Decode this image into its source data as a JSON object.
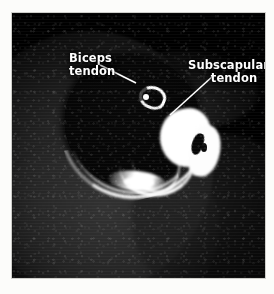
{
  "figure": {
    "kind": "medical-imaging-figure",
    "modality_appearance": "axial cross-sectional shoulder scan, greyscale",
    "background_color": "#fcfcfa",
    "scan_background_color": "#000000",
    "label_color": "#ffffff"
  },
  "annotations": [
    {
      "id": "biceps",
      "name": "biceps-tendon-label",
      "line1": "Biceps",
      "line2": "tendon",
      "align": "left",
      "leader": {
        "from_x": 100,
        "from_y": 65,
        "to_x": 136,
        "to_y": 83,
        "color": "#ffffff"
      }
    },
    {
      "id": "subscapularis",
      "name": "subscapularis-tendon-label",
      "line1": "Subscapularis",
      "line2": "tendon",
      "align": "center",
      "leader": {
        "from_x": 213,
        "from_y": 76,
        "to_x": 170,
        "to_y": 115,
        "color": "#ffffff"
      }
    }
  ],
  "structures": [
    {
      "name": "humeral-head",
      "appearance": "large dark round region, left of center"
    },
    {
      "name": "biceps-tendon",
      "appearance": "small bright hooked signal in bicipital groove"
    },
    {
      "name": "subscapularis-tendon",
      "appearance": "bright irregular mass, right of center"
    },
    {
      "name": "joint-capsule-band",
      "appearance": "thin bright band sweeping infero-medially"
    },
    {
      "name": "cortical-rim",
      "appearance": "bright curved cortex along infero-lateral humeral head"
    },
    {
      "name": "soft-tissue",
      "appearance": "mottled dark grey muscle surrounding the joint"
    }
  ]
}
